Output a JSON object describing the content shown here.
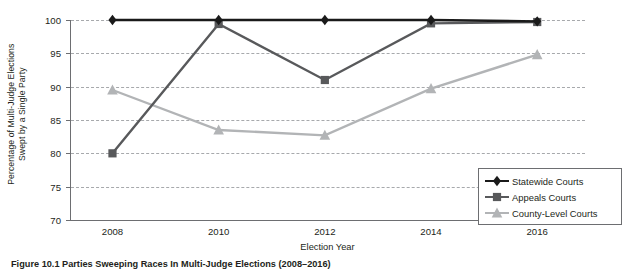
{
  "chart_data": {
    "type": "line",
    "title": "",
    "xlabel": "Election Year",
    "ylabel_line1": "Percentage of  Multi-Judge Elections",
    "ylabel_line2": "Swept by a Single Party",
    "x": [
      2008,
      2010,
      2012,
      2014,
      2016
    ],
    "xticklabels": [
      "2008",
      "2010",
      "2012",
      "2014",
      "2016"
    ],
    "yticklabels": [
      "70",
      "75",
      "80",
      "85",
      "90",
      "95",
      "100"
    ],
    "yticks": [
      70,
      75,
      80,
      85,
      90,
      95,
      100
    ],
    "ylim": [
      70,
      100
    ],
    "xlim": [
      2007.2,
      2016.9
    ],
    "grid": true,
    "legend_position": "lower-right-inside",
    "series": [
      {
        "name": "Statewide Courts",
        "values": [
          100,
          100,
          100,
          100,
          99.8
        ],
        "color": "#1a1a1a",
        "marker": "diamond"
      },
      {
        "name": "Appeals Courts",
        "values": [
          80.0,
          99.4,
          91.0,
          99.5,
          99.7
        ],
        "color": "#58595b",
        "marker": "square"
      },
      {
        "name": "County-Level Courts",
        "values": [
          89.5,
          83.5,
          82.7,
          89.7,
          94.8
        ],
        "color": "#b2b4b6",
        "marker": "triangle"
      }
    ]
  },
  "legend": {
    "items": [
      {
        "label": "Statewide Courts",
        "color": "#1a1a1a",
        "marker": "diamond"
      },
      {
        "label": "Appeals Courts",
        "color": "#58595b",
        "marker": "square"
      },
      {
        "label": "County-Level Courts",
        "color": "#b2b4b6",
        "marker": "triangle"
      }
    ]
  },
  "caption": "Figure 10.1    Parties Sweeping Races In Multi-Judge Elections  (2008–2016)"
}
